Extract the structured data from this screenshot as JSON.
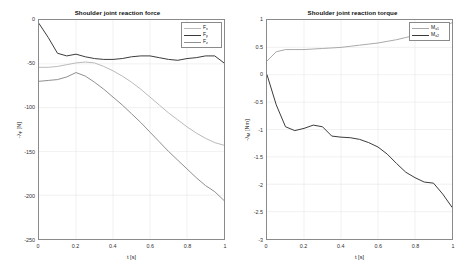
{
  "figure": {
    "background": "#ffffff",
    "axis_color": "#8a8a8a",
    "grid_color": "#e2e2e2"
  },
  "panels": [
    {
      "id": "force",
      "title": "Shoulder joint reaction force",
      "xlabel": "t [s]",
      "ylabel_main": "-λ",
      "ylabel_sub": "F",
      "ylabel_unit": " [N]",
      "xticks": [
        "0",
        "0.2",
        "0.4",
        "0.6",
        "0.8",
        "1"
      ],
      "yticks": [
        "0",
        "-50",
        "-100",
        "-150",
        "-200",
        "-250"
      ],
      "legend": [
        {
          "label_main": "F",
          "label_sub": "x",
          "color": "#b9b9b9"
        },
        {
          "label_main": "F",
          "label_sub": "y",
          "color": "#3a3a3a"
        },
        {
          "label_main": "F",
          "label_sub": "z",
          "color": "#8e8e8e"
        }
      ]
    },
    {
      "id": "torque",
      "title": "Shoulder joint reaction torque",
      "xlabel": "t [s]",
      "ylabel_main": "-λ",
      "ylabel_sub": "M",
      "ylabel_unit": " [Nm]",
      "xticks": [
        "0",
        "0.2",
        "0.4",
        "0.6",
        "0.8",
        "1"
      ],
      "yticks": [
        "1",
        "0.5",
        "0",
        "-0.5",
        "-1",
        "-1.5",
        "-2",
        "-2.5",
        "-3"
      ],
      "legend": [
        {
          "label_main": "M",
          "label_sub": "x1",
          "color": "#a8a8a8"
        },
        {
          "label_main": "M",
          "label_sub": "x2",
          "color": "#3a3a3a"
        }
      ]
    }
  ],
  "chart_data": [
    {
      "type": "line",
      "title": "Shoulder joint reaction force",
      "xlabel": "t [s]",
      "ylabel": "-λ_F [N]",
      "xlim": [
        0,
        1
      ],
      "ylim": [
        -250,
        0
      ],
      "grid": true,
      "legend_position": "top-right",
      "x": [
        0,
        0.05,
        0.1,
        0.15,
        0.2,
        0.25,
        0.3,
        0.35,
        0.4,
        0.45,
        0.5,
        0.55,
        0.6,
        0.65,
        0.7,
        0.75,
        0.8,
        0.85,
        0.9,
        0.95,
        1.0
      ],
      "series": [
        {
          "name": "F_x",
          "color": "#b9b9b9",
          "values": [
            -54,
            -54,
            -53,
            -51,
            -49,
            -48,
            -49,
            -53,
            -58,
            -64,
            -71,
            -79,
            -88,
            -97,
            -106,
            -114,
            -122,
            -129,
            -135,
            -140,
            -143
          ]
        },
        {
          "name": "F_y",
          "color": "#3a3a3a",
          "values": [
            -4,
            -20,
            -38,
            -41,
            -39,
            -42,
            -44,
            -45,
            -45,
            -44,
            -42,
            -41,
            -41,
            -43,
            -45,
            -46,
            -44,
            -43,
            -41,
            -41,
            -49
          ]
        },
        {
          "name": "F_z",
          "color": "#8e8e8e",
          "values": [
            -70,
            -69,
            -68,
            -65,
            -60,
            -64,
            -71,
            -79,
            -88,
            -97,
            -107,
            -117,
            -128,
            -139,
            -150,
            -160,
            -170,
            -180,
            -189,
            -196,
            -206
          ]
        }
      ]
    },
    {
      "type": "line",
      "title": "Shoulder joint reaction torque",
      "xlabel": "t [s]",
      "ylabel": "-λ_M [Nm]",
      "xlim": [
        0,
        1
      ],
      "ylim": [
        -3,
        1
      ],
      "grid": true,
      "legend_position": "top-right",
      "x": [
        0,
        0.05,
        0.1,
        0.15,
        0.2,
        0.25,
        0.3,
        0.35,
        0.4,
        0.45,
        0.5,
        0.55,
        0.6,
        0.65,
        0.7,
        0.75,
        0.8,
        0.85,
        0.9,
        0.95,
        1.0
      ],
      "series": [
        {
          "name": "M_x1",
          "color": "#a8a8a8",
          "values": [
            0.25,
            0.42,
            0.46,
            0.46,
            0.46,
            0.47,
            0.48,
            0.49,
            0.5,
            0.52,
            0.54,
            0.56,
            0.58,
            0.61,
            0.64,
            0.68,
            0.72,
            0.77,
            0.82,
            0.88,
            0.95
          ]
        },
        {
          "name": "M_x2",
          "color": "#3a3a3a",
          "values": [
            0.0,
            -0.55,
            -0.95,
            -1.02,
            -0.98,
            -0.92,
            -0.95,
            -1.12,
            -1.14,
            -1.15,
            -1.18,
            -1.24,
            -1.32,
            -1.45,
            -1.62,
            -1.78,
            -1.88,
            -1.96,
            -1.98,
            -2.18,
            -2.42
          ]
        }
      ]
    }
  ]
}
